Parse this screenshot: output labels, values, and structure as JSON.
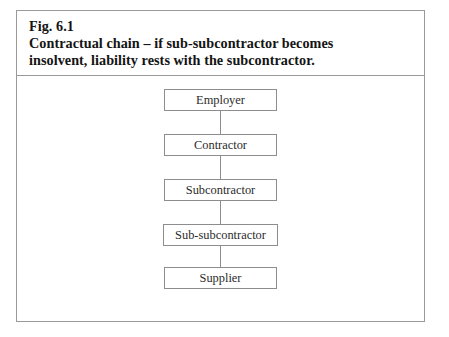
{
  "figure": {
    "caption": {
      "label": "Fig. 6.1",
      "line2": "Contractual chain – if sub-subcontractor becomes",
      "line3": "insolvent, liability rests with the subcontractor."
    },
    "diagram": {
      "type": "flow-chain",
      "orientation": "vertical",
      "nodes": [
        {
          "label": "Employer"
        },
        {
          "label": "Contractor"
        },
        {
          "label": "Subcontractor"
        },
        {
          "label": "Sub-subcontractor"
        },
        {
          "label": "Supplier"
        }
      ]
    },
    "colors": {
      "frame_border": "#9a9a9a",
      "box_border": "#8d8d8d",
      "connector": "#8d8d8d",
      "caption_text": "#141414",
      "node_text": "#2b2b2b",
      "background": "#ffffff"
    }
  }
}
